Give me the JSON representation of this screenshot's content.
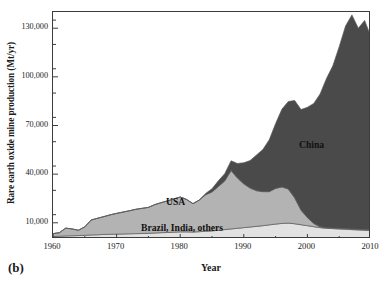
{
  "figure": {
    "panel_letter": "(b)",
    "xlabel": "Year",
    "ylabel": "Rare earth oxide mine production (Mt/yr)"
  },
  "labels": {
    "china": "China",
    "usa": "USA",
    "brazil": "Brazil, India, others"
  },
  "colors": {
    "china": "#4a4a4a",
    "usa": "#b3b3b3",
    "brazil": "#e2e2e2",
    "axis": "#3c3c3c",
    "background": "#ffffff"
  },
  "chart_data": {
    "type": "area",
    "stacked": true,
    "title": "",
    "xlabel": "Year",
    "ylabel": "Rare earth oxide mine production (Mt/yr)",
    "xlim": [
      1960,
      2010
    ],
    "ylim": [
      0,
      140000
    ],
    "xticks": [
      1960,
      1970,
      1980,
      1990,
      2000,
      2010
    ],
    "yticks": [
      10000,
      40000,
      70000,
      100000,
      130000
    ],
    "ytick_labels": [
      "10,000",
      "40,000",
      "70,000",
      "100,000",
      "130,000"
    ],
    "y_minor_tick_interval": 15000,
    "grid": false,
    "legend": "in-plot annotations",
    "x": [
      1960,
      1961,
      1962,
      1963,
      1964,
      1965,
      1966,
      1967,
      1968,
      1969,
      1970,
      1971,
      1972,
      1973,
      1974,
      1975,
      1976,
      1977,
      1978,
      1979,
      1980,
      1981,
      1982,
      1983,
      1984,
      1985,
      1986,
      1987,
      1988,
      1989,
      1990,
      1991,
      1992,
      1993,
      1994,
      1995,
      1996,
      1997,
      1998,
      1999,
      2000,
      2001,
      2002,
      2003,
      2004,
      2005,
      2006,
      2007,
      2008,
      2009,
      2010
    ],
    "series": [
      {
        "name": "Brazil, India, others",
        "color": "#e2e2e2",
        "values": [
          1500,
          1700,
          1900,
          2000,
          2100,
          2300,
          2500,
          2600,
          2800,
          2900,
          3000,
          3100,
          3200,
          3300,
          3400,
          3500,
          3700,
          3900,
          4000,
          4200,
          4400,
          4400,
          4300,
          4500,
          4800,
          5000,
          5400,
          5800,
          6200,
          6600,
          7000,
          7400,
          7800,
          8200,
          8700,
          9200,
          9600,
          9800,
          9400,
          8800,
          8200,
          7600,
          7000,
          6600,
          6400,
          6200,
          6000,
          5800,
          5600,
          5400,
          5200
        ]
      },
      {
        "name": "USA",
        "color": "#b3b3b3",
        "values": [
          1800,
          2200,
          4800,
          4200,
          3300,
          5200,
          9200,
          10200,
          11000,
          12000,
          12800,
          13500,
          14200,
          15000,
          15500,
          16000,
          17500,
          18500,
          19500,
          20500,
          21500,
          20000,
          17500,
          19500,
          22500,
          24000,
          27000,
          30000,
          36000,
          31000,
          27000,
          24000,
          22000,
          21000,
          20500,
          22000,
          22500,
          21000,
          16000,
          9000,
          5000,
          2000,
          500,
          400,
          400,
          400,
          400,
          400,
          400,
          400,
          400
        ]
      },
      {
        "name": "China",
        "color": "#4a4a4a",
        "values": [
          0,
          0,
          0,
          0,
          0,
          0,
          0,
          0,
          0,
          0,
          0,
          0,
          0,
          0,
          0,
          0,
          0,
          0,
          0,
          0,
          0,
          0,
          0,
          0,
          800,
          2000,
          3500,
          4500,
          6000,
          9000,
          13000,
          17000,
          22000,
          26000,
          32000,
          40000,
          48000,
          54000,
          60000,
          62000,
          68000,
          74000,
          82000,
          92000,
          100000,
          112000,
          125000,
          132000,
          124000,
          129000,
          119000
        ]
      }
    ],
    "annotations": [
      {
        "text": "China",
        "x": 2000,
        "y": 72000
      },
      {
        "text": "USA",
        "x": 1978,
        "y": 18000
      },
      {
        "text": "Brazil, India, others",
        "x": 1982,
        "y": 4000
      }
    ]
  }
}
